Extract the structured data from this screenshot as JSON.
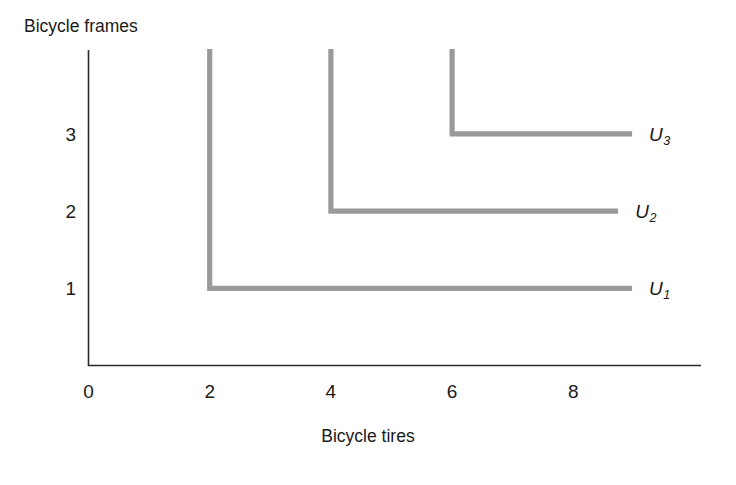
{
  "chart_data": {
    "type": "line",
    "title": "",
    "xlabel": "Bicycle tires",
    "ylabel": "Bicycle frames",
    "xlim": [
      0,
      10.1
    ],
    "ylim": [
      0,
      4.1
    ],
    "xticks": [
      0,
      2,
      4,
      6,
      8
    ],
    "xtick_labels": [
      "0",
      "2",
      "4",
      "6",
      "8"
    ],
    "yticks": [
      1,
      2,
      3
    ],
    "ytick_labels": [
      "1",
      "2",
      "3"
    ],
    "grid": false,
    "legend_position": "right-inline",
    "line_color": "#9a9a9a",
    "axis_color": "#2b2b2b",
    "background": "#ffffff",
    "series": [
      {
        "name": "U1",
        "label": "U",
        "subscript": "1",
        "kink": {
          "x": 2,
          "y": 1
        },
        "vertical_top_y": 4.1,
        "horizontal_end_x": 8.97,
        "points": [
          [
            2,
            4.1
          ],
          [
            2,
            1
          ],
          [
            8.97,
            1
          ]
        ]
      },
      {
        "name": "U2",
        "label": "U",
        "subscript": "2",
        "kink": {
          "x": 4,
          "y": 2
        },
        "vertical_top_y": 4.1,
        "horizontal_end_x": 8.74,
        "points": [
          [
            4,
            4.1
          ],
          [
            4,
            2
          ],
          [
            8.74,
            2
          ]
        ]
      },
      {
        "name": "U3",
        "label": "U",
        "subscript": "3",
        "kink": {
          "x": 6,
          "y": 3
        },
        "vertical_top_y": 4.1,
        "horizontal_end_x": 8.97,
        "points": [
          [
            6,
            4.1
          ],
          [
            6,
            3
          ],
          [
            8.97,
            3
          ]
        ]
      }
    ]
  },
  "axes": {
    "y_title": "Bicycle frames",
    "x_title": "Bicycle tires",
    "x_tick_labels": [
      "0",
      "2",
      "4",
      "6",
      "8"
    ],
    "y_tick_labels": [
      "1",
      "2",
      "3"
    ]
  },
  "curve_labels": [
    {
      "base": "U",
      "sub": "1"
    },
    {
      "base": "U",
      "sub": "2"
    },
    {
      "base": "U",
      "sub": "3"
    }
  ]
}
